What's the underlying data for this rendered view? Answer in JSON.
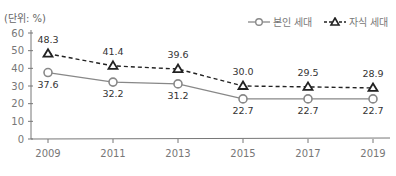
{
  "chart_data": {
    "type": "line",
    "title": "",
    "unit_label": "(단위: %)",
    "xlabel": "",
    "ylabel": "%",
    "ylim": [
      0,
      60
    ],
    "yticks": [
      0,
      10,
      20,
      30,
      40,
      50,
      60
    ],
    "categories": [
      "2009",
      "2011",
      "2013",
      "2015",
      "2017",
      "2019"
    ],
    "grid": false,
    "legend_position": "top-right",
    "series": [
      {
        "name": "본인 세대",
        "style": "solid",
        "marker": "circle",
        "color": "#888888",
        "values": [
          37.6,
          32.2,
          31.2,
          22.7,
          22.7,
          22.7
        ],
        "labels": [
          "37.6",
          "32.2",
          "31.2",
          "22.7",
          "22.7",
          "22.7"
        ]
      },
      {
        "name": "자식 세대",
        "style": "dashed",
        "marker": "triangle",
        "color": "#222222",
        "values": [
          48.3,
          41.4,
          39.6,
          30.0,
          29.5,
          28.9
        ],
        "labels": [
          "48.3",
          "41.4",
          "39.6",
          "30.0",
          "29.5",
          "28.9"
        ]
      }
    ]
  }
}
